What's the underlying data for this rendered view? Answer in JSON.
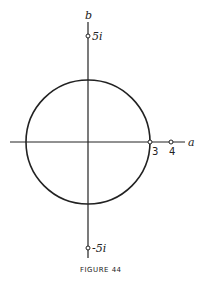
{
  "figure": {
    "caption": "FIGURE 44",
    "axes": {
      "horizontal_label": "a",
      "vertical_label": "b"
    },
    "points": [
      {
        "label": "5i",
        "position": "imag-axis-top"
      },
      {
        "label": "-5i",
        "position": "imag-axis-bottom"
      },
      {
        "label": "3",
        "position": "real-axis"
      },
      {
        "label": "4",
        "position": "real-axis"
      }
    ],
    "circle": {
      "center": "origin",
      "radius_label": "3"
    },
    "colors": {
      "stroke": "#222222",
      "background": "#ffffff"
    }
  }
}
